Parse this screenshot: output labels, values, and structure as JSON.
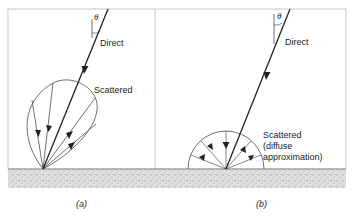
{
  "panels": [
    {
      "id": "a",
      "caption": "(a)",
      "angle_label": "θ",
      "direct_label": "Direct",
      "scattered_label": "Scattered"
    },
    {
      "id": "b",
      "caption": "(b)",
      "angle_label": "θ",
      "direct_label": "Direct",
      "scattered_label_lines": [
        "Scattered",
        "(diffuse",
        "approximation)"
      ]
    }
  ],
  "colors": {
    "line": "#222222",
    "frame": "#bbbbbb",
    "ground": "#d9d9d9"
  }
}
